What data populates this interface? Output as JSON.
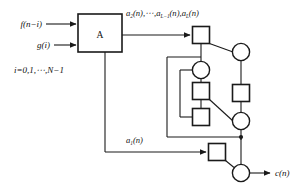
{
  "figure": {
    "type": "block-diagram",
    "background_color": "#ffffff",
    "line_color": "#1a1a1a",
    "node_fill": "#ffffff"
  },
  "blocks": {
    "processor": {
      "label": "A",
      "name": "block-a"
    }
  },
  "labels": {
    "input_f": "f(n−i)",
    "input_g": "g(i)",
    "index_range": "i=0,1,⋯,N−1",
    "coef_stream_parts": {
      "first": "a",
      "first_sub": "2",
      "first_tail": "(n),⋯,",
      "second": "a",
      "second_sub": "L−1",
      "second_tail": "(n),",
      "third": "a",
      "third_sub": "L",
      "third_tail": "(n)"
    },
    "coef_stream_plain": "a2(n),⋯,aL−1(n),aL(n)",
    "coef_a1_base": "a",
    "coef_a1_sub": "1",
    "coef_a1_tail": "(n)",
    "coef_a1_plain": "a1(n)",
    "output_c_base": "c",
    "output_c_tail": "(n)",
    "output_c_plain": "c(n)"
  },
  "nodes": [
    {
      "id": "sq-top",
      "shape": "square",
      "cx": 201,
      "cy": 35,
      "size": 17,
      "name": "square-node-top"
    },
    {
      "id": "cir-right-top",
      "shape": "circle",
      "cx": 241,
      "cy": 52,
      "r": 9,
      "name": "circle-node-right-top"
    },
    {
      "id": "cir-mid",
      "shape": "circle",
      "cx": 201,
      "cy": 70,
      "r": 9,
      "name": "circle-node-middle"
    },
    {
      "id": "sq-mid",
      "shape": "square",
      "cx": 201,
      "cy": 91,
      "size": 17,
      "name": "square-node-middle"
    },
    {
      "id": "sq-low",
      "shape": "square",
      "cx": 201,
      "cy": 117,
      "size": 17,
      "name": "square-node-lower"
    },
    {
      "id": "sq-right",
      "shape": "square",
      "cx": 241,
      "cy": 93,
      "size": 17,
      "name": "square-node-right"
    },
    {
      "id": "cir-right-bot",
      "shape": "circle",
      "cx": 241,
      "cy": 121,
      "r": 9,
      "name": "circle-node-right-bottom"
    },
    {
      "id": "sq-bottom",
      "shape": "square",
      "cx": 217,
      "cy": 152,
      "size": 17,
      "name": "square-node-bottom"
    },
    {
      "id": "cir-out",
      "shape": "circle",
      "cx": 241,
      "cy": 173,
      "r": 9,
      "name": "circle-node-output"
    }
  ],
  "junctions": [
    {
      "id": "j-bus",
      "cx": 241,
      "cy": 137,
      "name": "junction-dot-bus"
    }
  ],
  "arrows": [
    {
      "name": "arrow-input-f",
      "from_x": 46,
      "to_x": 78,
      "y": 24
    },
    {
      "name": "arrow-input-g",
      "from_x": 54,
      "to_x": 78,
      "y": 45
    },
    {
      "name": "arrow-coef-bus",
      "from_x": 122,
      "to_x": 192,
      "y": 35
    },
    {
      "name": "arrow-a1",
      "from_x": 105,
      "to_x": 208,
      "y": 152
    },
    {
      "name": "arrow-output-c",
      "from_x": 250,
      "to_x": 272,
      "y": 173
    }
  ]
}
